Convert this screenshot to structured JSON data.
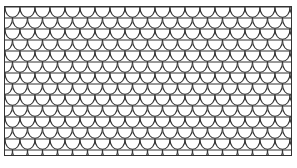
{
  "pattern": {
    "name": "fish-scale",
    "stroke_color": "#333333",
    "fill_color": "#ffffff",
    "scale_width": 15,
    "row_height": 11
  }
}
